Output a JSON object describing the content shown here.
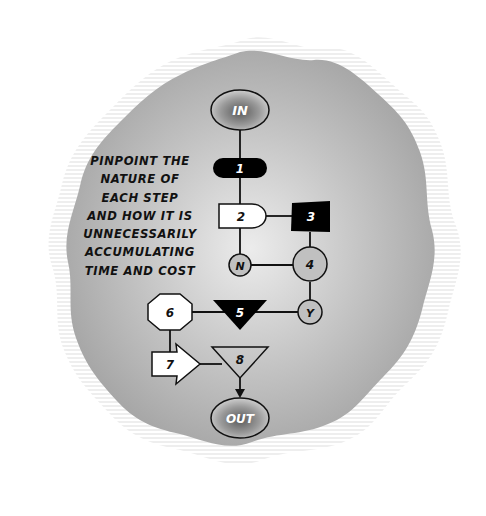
{
  "caption": {
    "lines": [
      "PINPOINT THE",
      "NATURE OF",
      "EACH STEP",
      "AND HOW IT IS",
      "UNNECESSARILY",
      "ACCUMULATING",
      "TIME AND COST"
    ]
  },
  "nodes": {
    "start": {
      "label": "IN",
      "shape": "ellipse"
    },
    "n1": {
      "label": "1",
      "shape": "rounded-pill",
      "fill": "#000000"
    },
    "n2": {
      "label": "2",
      "shape": "delay",
      "fill": "#ffffff"
    },
    "n3": {
      "label": "3",
      "shape": "square",
      "fill": "#000000"
    },
    "no": {
      "label": "N",
      "shape": "circle"
    },
    "n4": {
      "label": "4",
      "shape": "circle"
    },
    "yes": {
      "label": "Y",
      "shape": "circle"
    },
    "n5": {
      "label": "5",
      "shape": "inverted-triangle",
      "fill": "#000000"
    },
    "n6": {
      "label": "6",
      "shape": "octagon",
      "fill": "#ffffff"
    },
    "n7": {
      "label": "7",
      "shape": "arrow",
      "fill": "#ffffff"
    },
    "n8": {
      "label": "8",
      "shape": "inverted-triangle",
      "fill": "none"
    },
    "end": {
      "label": "OUT",
      "shape": "ellipse"
    }
  },
  "colors": {
    "background": "#ffffff",
    "blob_center": "#e6e6e6",
    "blob_edge": "#a6a6a6",
    "stroke": "#111111"
  }
}
